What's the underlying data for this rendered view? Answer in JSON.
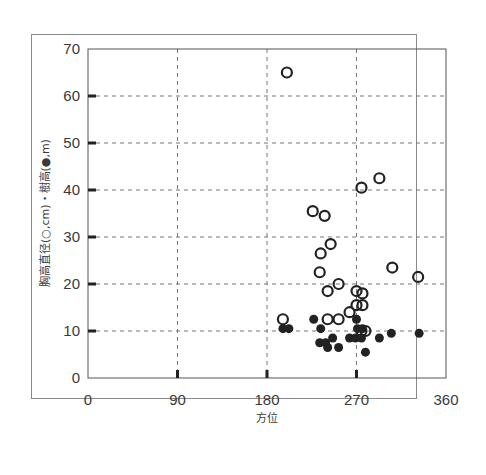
{
  "chart_data": {
    "type": "scatter",
    "title": "",
    "xlabel": "方位",
    "ylabel": "胸高直径(○,cm)・樹高(●,m)",
    "xlim": [
      0,
      360
    ],
    "ylim": [
      0,
      70
    ],
    "x_ticks": [
      0,
      90,
      180,
      270,
      360
    ],
    "y_ticks": [
      0,
      10,
      20,
      30,
      40,
      50,
      60,
      70
    ],
    "grid": true,
    "grid_style": "dashed",
    "legend": "none (encoded in y-axis label: open circle = DBH cm, filled circle = tree height m)",
    "series": [
      {
        "name": "胸高直径 (○, cm)",
        "marker": "open-circle",
        "points": [
          [
            200,
            65
          ],
          [
            226,
            35.5
          ],
          [
            238,
            34.5
          ],
          [
            275,
            40.5
          ],
          [
            293,
            42.5
          ],
          [
            234,
            26.5
          ],
          [
            244,
            28.5
          ],
          [
            233,
            22.5
          ],
          [
            241,
            18.5
          ],
          [
            252,
            20
          ],
          [
            270,
            18.5
          ],
          [
            276,
            18
          ],
          [
            270,
            15.5
          ],
          [
            276,
            15.5
          ],
          [
            263,
            14
          ],
          [
            196,
            12.5
          ],
          [
            241,
            12.5
          ],
          [
            252,
            12.5
          ],
          [
            306,
            23.5
          ],
          [
            332,
            21.5
          ],
          [
            279,
            10
          ],
          [
            275,
            10
          ]
        ]
      },
      {
        "name": "樹高 (●, m)",
        "marker": "filled-circle",
        "points": [
          [
            196,
            10.5
          ],
          [
            202,
            10.5
          ],
          [
            227,
            12.5
          ],
          [
            234,
            10.5
          ],
          [
            270,
            12.5
          ],
          [
            246,
            8.5
          ],
          [
            233,
            7.5
          ],
          [
            239,
            7.5
          ],
          [
            241,
            6.5
          ],
          [
            252,
            6.5
          ],
          [
            263,
            8.5
          ],
          [
            269,
            8.5
          ],
          [
            275,
            8.5
          ],
          [
            271,
            10.5
          ],
          [
            276,
            10.5
          ],
          [
            279,
            5.5
          ],
          [
            293,
            8.5
          ],
          [
            305,
            9.5
          ],
          [
            333,
            9.5
          ]
        ]
      }
    ]
  },
  "axes": {
    "x_title": "方位",
    "y_title": "胸高直径(○,cm)・樹高(●,m)"
  }
}
